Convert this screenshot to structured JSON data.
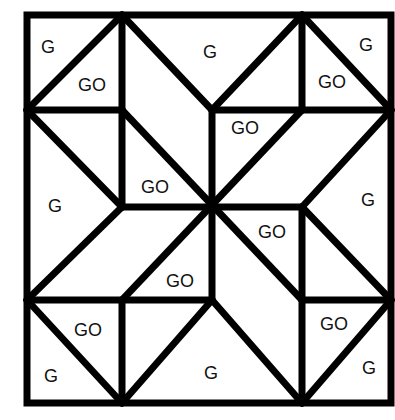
{
  "diagram": {
    "type": "quilt-block",
    "colors": {
      "line": "#000000",
      "fill": "#ffffff",
      "text": "#111111"
    },
    "legend": {
      "G": "G",
      "GO": "GO"
    },
    "labels": [
      {
        "id": "tl-corner",
        "text": "G",
        "x": 48,
        "y": 47
      },
      {
        "id": "tl-inner",
        "text": "GO",
        "x": 92,
        "y": 85
      },
      {
        "id": "top-mid",
        "text": "G",
        "x": 210,
        "y": 52
      },
      {
        "id": "tr-inner",
        "text": "GO",
        "x": 332,
        "y": 82
      },
      {
        "id": "tr-corner",
        "text": "G",
        "x": 366,
        "y": 45
      },
      {
        "id": "upper-center-go",
        "text": "GO",
        "x": 245,
        "y": 128
      },
      {
        "id": "left-center-go",
        "text": "GO",
        "x": 155,
        "y": 187
      },
      {
        "id": "left-mid",
        "text": "G",
        "x": 55,
        "y": 206
      },
      {
        "id": "right-mid",
        "text": "G",
        "x": 368,
        "y": 200
      },
      {
        "id": "right-center-go",
        "text": "GO",
        "x": 272,
        "y": 232
      },
      {
        "id": "lower-center-go",
        "text": "GO",
        "x": 180,
        "y": 281
      },
      {
        "id": "bl-inner",
        "text": "GO",
        "x": 88,
        "y": 330
      },
      {
        "id": "bl-corner",
        "text": "G",
        "x": 51,
        "y": 376
      },
      {
        "id": "bottom-mid",
        "text": "G",
        "x": 211,
        "y": 373
      },
      {
        "id": "br-inner",
        "text": "GO",
        "x": 334,
        "y": 324
      },
      {
        "id": "br-corner",
        "text": "G",
        "x": 369,
        "y": 368
      }
    ]
  }
}
